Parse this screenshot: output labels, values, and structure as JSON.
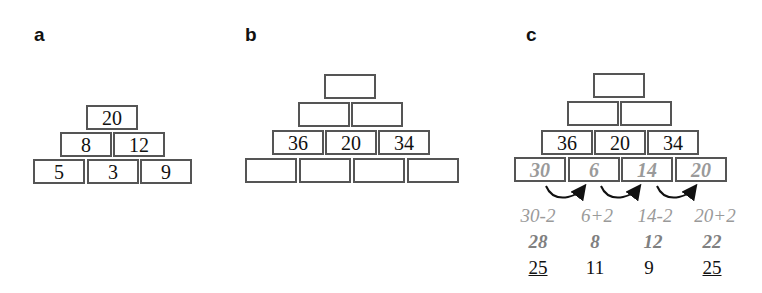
{
  "panels": {
    "a": {
      "label": "a",
      "rows": [
        [
          "20"
        ],
        [
          "8",
          "12"
        ],
        [
          "5",
          "3",
          "9"
        ]
      ]
    },
    "b": {
      "label": "b",
      "rows": [
        [
          ""
        ],
        [
          "",
          ""
        ],
        [
          "36",
          "20",
          "34"
        ],
        [
          "",
          "",
          "",
          ""
        ]
      ]
    },
    "c": {
      "label": "c",
      "rows": [
        [
          ""
        ],
        [
          "",
          ""
        ],
        [
          "36",
          "20",
          "34"
        ],
        [
          "30",
          "6",
          "14",
          "20"
        ]
      ],
      "expressions": [
        "30-2",
        "6+2",
        "14-2",
        "20+2"
      ],
      "results": [
        "28",
        "8",
        "12",
        "22"
      ],
      "answers": [
        "25",
        "11",
        "9",
        "25"
      ],
      "underlined_answers": [
        0,
        3
      ]
    }
  },
  "colors": {
    "box_border": "#555555",
    "hint_text": "#9a9a9a",
    "result_text": "#808080",
    "main_text": "#111111"
  }
}
